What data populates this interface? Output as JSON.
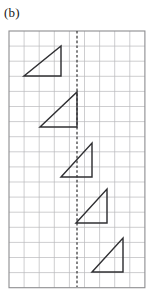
{
  "figure": {
    "panel_label": "(b)",
    "caption_label": "(b)",
    "colors": {
      "background": "#ffffff",
      "grid_line": "#b9b9bb",
      "grid_border": "#8d8d90",
      "mirror_line": "#3a3a3c",
      "triangle_stroke": "#303033"
    },
    "grid": {
      "x0": 9,
      "y0": 31,
      "cell": 15.1,
      "columns": 9,
      "rows": 17,
      "width": 135.9,
      "height": 256.7,
      "grid_visible": "true"
    },
    "mirror": {
      "name": "dashed vertical line",
      "x": 77,
      "y_top": 31,
      "y_bottom": 287,
      "style": "dashed",
      "column_index": 4.5
    },
    "shapes": [
      {
        "id": "triangle-1",
        "label": "triangle 1",
        "type": "right-triangle",
        "right_angle_corner": "top-right",
        "points": "24,76 61,76 61,46",
        "vertices": [
          [
            24,
            76
          ],
          [
            61,
            76
          ],
          [
            61,
            46
          ]
        ],
        "width_cells": 2.45,
        "height_cells": 2.0
      },
      {
        "id": "triangle-2",
        "label": "triangle 2",
        "type": "right-triangle",
        "right_angle_corner": "top-right",
        "points": "40,127 77,127 77,92",
        "vertices": [
          [
            40,
            127
          ],
          [
            77,
            127
          ],
          [
            77,
            92
          ]
        ],
        "width_cells": 2.45,
        "height_cells": 2.3
      },
      {
        "id": "triangle-3",
        "label": "triangle 3",
        "type": "right-triangle",
        "right_angle_corner": "top-right",
        "points": "61,177 92,177 92,143",
        "vertices": [
          [
            61,
            177
          ],
          [
            92,
            177
          ],
          [
            92,
            143
          ]
        ],
        "width_cells": 2.05,
        "height_cells": 2.25
      },
      {
        "id": "triangle-4",
        "label": "triangle 4",
        "type": "right-triangle",
        "right_angle_corner": "top-right",
        "points": "76,223 107,223 107,189",
        "vertices": [
          [
            76,
            223
          ],
          [
            107,
            223
          ],
          [
            107,
            189
          ]
        ],
        "width_cells": 2.05,
        "height_cells": 2.25
      },
      {
        "id": "triangle-5",
        "label": "triangle 5",
        "type": "right-triangle",
        "right_angle_corner": "top-right",
        "points": "92,272 123,272 123,238",
        "vertices": [
          [
            92,
            272
          ],
          [
            123,
            272
          ],
          [
            123,
            238
          ]
        ],
        "width_cells": 2.05,
        "height_cells": 2.25
      }
    ]
  }
}
